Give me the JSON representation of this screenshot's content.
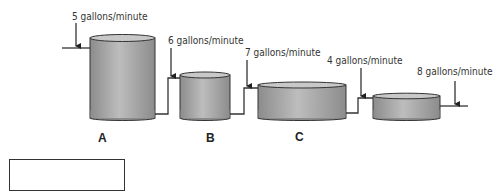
{
  "diagram": {
    "colors": {
      "tank_light": "#bdbdbd",
      "tank_dark": "#8c8c8c",
      "stroke": "#333333",
      "pipe": "#333333"
    },
    "rates": [
      {
        "id": "inflow-a",
        "text": "5 gallons/minute"
      },
      {
        "id": "a-to-b",
        "text": "6 gallons/minute"
      },
      {
        "id": "b-to-c",
        "text": "7 gallons/minute"
      },
      {
        "id": "c-to-d",
        "text": "4 gallons/minute"
      },
      {
        "id": "outflow-d",
        "text": "8 gallons/minute"
      }
    ],
    "tanks": [
      {
        "label": "A"
      },
      {
        "label": "B"
      },
      {
        "label": "C"
      },
      {
        "label": ""
      }
    ],
    "answer_box": {
      "value": ""
    }
  }
}
